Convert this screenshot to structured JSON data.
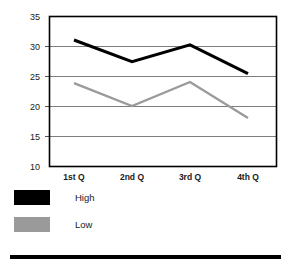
{
  "chart_data": {
    "type": "line",
    "title": "",
    "subtitle": "",
    "xlabel": "",
    "ylabel": "",
    "categories": [
      "1st Q",
      "2nd Q",
      "3rd Q",
      "4th Q"
    ],
    "series": [
      {
        "name": "High",
        "values": [
          31,
          27.4,
          30.2,
          25.4
        ],
        "color": "#000000"
      },
      {
        "name": "Low",
        "values": [
          23.8,
          20,
          24,
          18
        ],
        "color": "#9a9a9a"
      }
    ],
    "ylim": [
      10,
      35
    ],
    "yticks": [
      10,
      15,
      20,
      25,
      30,
      35
    ],
    "ytick_labels": [
      "10",
      "15",
      "20",
      "25",
      "30",
      "35"
    ],
    "grid": "horizontal",
    "legend_position": "bottom-left",
    "annotations": []
  },
  "legend": {
    "items": [
      {
        "label": "High",
        "color": "#000000"
      },
      {
        "label": "Low",
        "color": "#9a9a9a"
      }
    ]
  },
  "colors": {
    "high": "#000000",
    "low": "#9a9a9a",
    "grid": "#7d7d7d",
    "frame": "#000000",
    "text": "#1a1a1a",
    "background": "#ffffff",
    "rule": "#000000"
  }
}
